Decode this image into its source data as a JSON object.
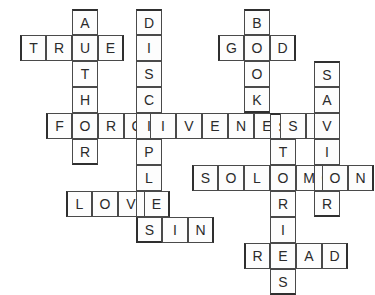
{
  "puzzle": {
    "title": "Bible Crossword Grid",
    "grid": {
      "cell_size": 26,
      "origin_x": 20,
      "origin_y": 9,
      "columns": 14,
      "rows": 11,
      "border_color": "#4a4a4a",
      "outline_color": "#2f2f2f",
      "cell_fill": "#fdfdfd",
      "letter_color": "#2b2b2b",
      "background": "#ffffff"
    },
    "entries": [
      {
        "id": "author",
        "answer": "AUTHOR",
        "direction": "down",
        "x": 72,
        "y": 9,
        "length": 6,
        "letters": [
          "A",
          "U",
          "T",
          "H",
          "O",
          "R"
        ]
      },
      {
        "id": "true",
        "answer": "TRUE",
        "direction": "across",
        "x": 20,
        "y": 35,
        "length": 4,
        "letters": [
          "T",
          "R",
          "U",
          "E"
        ]
      },
      {
        "id": "disciples",
        "answer": "DISCIPLES",
        "direction": "down",
        "x": 136,
        "y": 9,
        "length": 9,
        "letters": [
          "D",
          "I",
          "S",
          "C",
          "I",
          "P",
          "L",
          "E",
          "S"
        ]
      },
      {
        "id": "book",
        "answer": "BOOK",
        "direction": "down",
        "x": 244,
        "y": 9,
        "length": 4,
        "letters": [
          "B",
          "O",
          "O",
          "K"
        ]
      },
      {
        "id": "god",
        "answer": "GOD",
        "direction": "across",
        "x": 218,
        "y": 35,
        "length": 3,
        "letters": [
          "G",
          "O",
          "D"
        ]
      },
      {
        "id": "savior",
        "answer": "SAVIOR",
        "direction": "down",
        "x": 314,
        "y": 61,
        "length": 6,
        "letters": [
          "S",
          "A",
          "V",
          "I",
          "O",
          "R"
        ]
      },
      {
        "id": "forgiveness",
        "answer": "FORGIVENESS",
        "direction": "across",
        "x": 46,
        "y": 113,
        "length": 11,
        "letters": [
          "F",
          "O",
          "R",
          "G",
          "I",
          "V",
          "E",
          "N",
          "E",
          "S",
          "S"
        ]
      },
      {
        "id": "stories",
        "answer": "STORIES",
        "direction": "down",
        "x": 270,
        "y": 113,
        "length": 7,
        "letters": [
          "S",
          "T",
          "O",
          "R",
          "I",
          "E",
          "S"
        ]
      },
      {
        "id": "solomon",
        "answer": "SOLOMON",
        "direction": "across",
        "x": 192,
        "y": 165,
        "length": 7,
        "letters": [
          "S",
          "O",
          "L",
          "O",
          "M",
          "O",
          "N"
        ]
      },
      {
        "id": "love",
        "answer": "LOVE",
        "direction": "across",
        "x": 66,
        "y": 191,
        "length": 4,
        "letters": [
          "L",
          "O",
          "V",
          "E"
        ]
      },
      {
        "id": "sin",
        "answer": "SIN",
        "direction": "across",
        "x": 136,
        "y": 217,
        "length": 3,
        "letters": [
          "S",
          "I",
          "N"
        ]
      },
      {
        "id": "read",
        "answer": "READ",
        "direction": "across",
        "x": 244,
        "y": 243,
        "length": 4,
        "letters": [
          "R",
          "E",
          "A",
          "D"
        ]
      }
    ],
    "cells": [
      {
        "letter": "A",
        "x": 72,
        "y": 9,
        "name": "cell-author-1"
      },
      {
        "letter": "D",
        "x": 136,
        "y": 9,
        "name": "cell-disciples-1"
      },
      {
        "letter": "B",
        "x": 244,
        "y": 9,
        "name": "cell-book-1"
      },
      {
        "letter": "T",
        "x": 20,
        "y": 35,
        "name": "cell-true-1"
      },
      {
        "letter": "R",
        "x": 46,
        "y": 35,
        "name": "cell-true-2"
      },
      {
        "letter": "U",
        "x": 72,
        "y": 35,
        "name": "cell-true-3"
      },
      {
        "letter": "E",
        "x": 98,
        "y": 35,
        "name": "cell-true-4"
      },
      {
        "letter": "I",
        "x": 136,
        "y": 35,
        "name": "cell-disciples-2"
      },
      {
        "letter": "G",
        "x": 218,
        "y": 35,
        "name": "cell-god-1"
      },
      {
        "letter": "O",
        "x": 244,
        "y": 35,
        "name": "cell-god-2"
      },
      {
        "letter": "D",
        "x": 270,
        "y": 35,
        "name": "cell-god-3"
      },
      {
        "letter": "T",
        "x": 72,
        "y": 61,
        "name": "cell-author-3"
      },
      {
        "letter": "S",
        "x": 136,
        "y": 61,
        "name": "cell-disciples-3"
      },
      {
        "letter": "O",
        "x": 244,
        "y": 61,
        "name": "cell-book-3"
      },
      {
        "letter": "S",
        "x": 314,
        "y": 61,
        "name": "cell-savior-1"
      },
      {
        "letter": "H",
        "x": 72,
        "y": 87,
        "name": "cell-author-4"
      },
      {
        "letter": "C",
        "x": 136,
        "y": 87,
        "name": "cell-disciples-4"
      },
      {
        "letter": "K",
        "x": 244,
        "y": 87,
        "name": "cell-book-4"
      },
      {
        "letter": "A",
        "x": 314,
        "y": 87,
        "name": "cell-savior-2"
      },
      {
        "letter": "F",
        "x": 46,
        "y": 113,
        "name": "cell-forgiveness-1"
      },
      {
        "letter": "O",
        "x": 72,
        "y": 113,
        "name": "cell-forgiveness-2"
      },
      {
        "letter": "R",
        "x": 98,
        "y": 113,
        "name": "cell-forgiveness-3"
      },
      {
        "letter": "G",
        "x": 124,
        "y": 113,
        "name": "cell-forgiveness-4"
      },
      {
        "letter": "I",
        "x": 150,
        "y": 113,
        "name": "cell-forgiveness-5"
      },
      {
        "letter": "V",
        "x": 176,
        "y": 113,
        "name": "cell-forgiveness-6"
      },
      {
        "letter": "E",
        "x": 202,
        "y": 113,
        "name": "cell-forgiveness-7"
      },
      {
        "letter": "N",
        "x": 228,
        "y": 113,
        "name": "cell-forgiveness-8"
      },
      {
        "letter": "E",
        "x": 254,
        "y": 113,
        "name": "cell-forgiveness-9"
      },
      {
        "letter": "S",
        "x": 280,
        "y": 113,
        "name": "cell-forgiveness-10"
      },
      {
        "letter": "S",
        "x": 306,
        "y": 113,
        "name": "cell-forgiveness-11"
      },
      {
        "letter": "R",
        "x": 72,
        "y": 139,
        "name": "cell-author-6"
      },
      {
        "letter": "P",
        "x": 150,
        "y": 139,
        "name": "cell-disciples-6"
      },
      {
        "letter": "T",
        "x": 306,
        "y": 139,
        "name": "cell-stories-2"
      },
      {
        "letter": "V",
        "x": 340,
        "y": 139,
        "name": "cell-savior-3"
      },
      {
        "letter": "S",
        "x": 192,
        "y": 165,
        "name": "cell-solomon-1"
      },
      {
        "letter": "O",
        "x": 218,
        "y": 165,
        "name": "cell-solomon-2"
      },
      {
        "letter": "L",
        "x": 244,
        "y": 165,
        "name": "cell-solomon-3"
      },
      {
        "letter": "O",
        "x": 270,
        "y": 165,
        "name": "cell-solomon-4"
      },
      {
        "letter": "M",
        "x": 296,
        "y": 165,
        "name": "cell-solomon-5"
      },
      {
        "letter": "O",
        "x": 322,
        "y": 165,
        "name": "cell-solomon-6"
      },
      {
        "letter": "N",
        "x": 348,
        "y": 165,
        "name": "cell-solomon-7"
      },
      {
        "letter": "L",
        "x": 66,
        "y": 191,
        "name": "cell-love-1"
      },
      {
        "letter": "O",
        "x": 92,
        "y": 191,
        "name": "cell-love-2"
      },
      {
        "letter": "V",
        "x": 118,
        "y": 191,
        "name": "cell-love-3"
      },
      {
        "letter": "E",
        "x": 144,
        "y": 191,
        "name": "cell-love-4"
      },
      {
        "letter": "S",
        "x": 136,
        "y": 217,
        "name": "cell-sin-1"
      },
      {
        "letter": "I",
        "x": 162,
        "y": 217,
        "name": "cell-sin-2"
      },
      {
        "letter": "N",
        "x": 188,
        "y": 217,
        "name": "cell-sin-3"
      },
      {
        "letter": "R",
        "x": 244,
        "y": 243,
        "name": "cell-read-1"
      },
      {
        "letter": "E",
        "x": 270,
        "y": 243,
        "name": "cell-read-2"
      },
      {
        "letter": "A",
        "x": 296,
        "y": 243,
        "name": "cell-read-3"
      },
      {
        "letter": "D",
        "x": 322,
        "y": 243,
        "name": "cell-read-4"
      }
    ]
  }
}
